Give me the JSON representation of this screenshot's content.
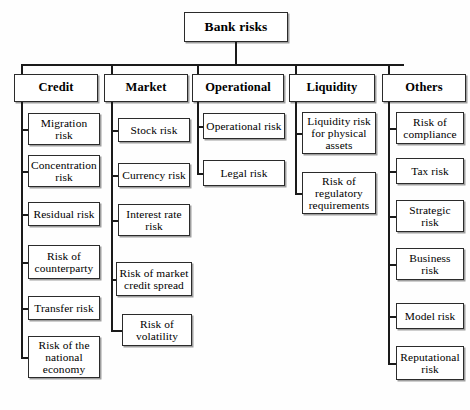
{
  "diagram": {
    "title": "Bank risks",
    "type": "hierarchy-tree",
    "root": {
      "label": "Bank risks",
      "x": 184,
      "y": 12,
      "w": 104,
      "h": 30
    },
    "bus": {
      "y": 64,
      "x1": 22,
      "x2": 404
    },
    "categories": [
      {
        "label": "Credit",
        "box": {
          "x": 14,
          "y": 74,
          "w": 84,
          "h": 28
        },
        "connector_x": 22,
        "children": [
          {
            "label": "Migration\nrisk",
            "x": 28,
            "y": 113,
            "w": 72,
            "h": 32
          },
          {
            "label": "Concentration\nrisk",
            "x": 28,
            "y": 155,
            "w": 72,
            "h": 32
          },
          {
            "label": "Residual risk",
            "x": 28,
            "y": 202,
            "w": 72,
            "h": 24
          },
          {
            "label": "Risk of\ncounterparty",
            "x": 28,
            "y": 245,
            "w": 72,
            "h": 34
          },
          {
            "label": "Transfer risk",
            "x": 28,
            "y": 296,
            "w": 72,
            "h": 24
          },
          {
            "label": "Risk of the\nnational\neconomy",
            "x": 28,
            "y": 336,
            "w": 72,
            "h": 42
          }
        ]
      },
      {
        "label": "Market",
        "box": {
          "x": 104,
          "y": 74,
          "w": 84,
          "h": 28
        },
        "connector_x": 112,
        "children": [
          {
            "label": "Stock risk",
            "x": 118,
            "y": 118,
            "w": 72,
            "h": 24
          },
          {
            "label": "Currency risk",
            "x": 118,
            "y": 163,
            "w": 72,
            "h": 24
          },
          {
            "label": "Interest rate\nrisk",
            "x": 118,
            "y": 204,
            "w": 72,
            "h": 32
          },
          {
            "label": "Risk of market\ncredit spread",
            "x": 116,
            "y": 262,
            "w": 76,
            "h": 34
          },
          {
            "label": "Risk of\nvolatility",
            "x": 122,
            "y": 314,
            "w": 70,
            "h": 32
          }
        ]
      },
      {
        "label": "Operational",
        "box": {
          "x": 192,
          "y": 74,
          "w": 92,
          "h": 28
        },
        "connector_x": 198,
        "children": [
          {
            "label": "Operational risk",
            "x": 203,
            "y": 113,
            "w": 82,
            "h": 26
          },
          {
            "label": "Legal risk",
            "x": 203,
            "y": 160,
            "w": 82,
            "h": 26
          }
        ]
      },
      {
        "label": "Liquidity",
        "box": {
          "x": 289,
          "y": 74,
          "w": 86,
          "h": 28
        },
        "connector_x": 296,
        "children": [
          {
            "label": "Liquidity  risk\nfor physical\nassets",
            "x": 302,
            "y": 112,
            "w": 74,
            "h": 42
          },
          {
            "label": "Risk of\nregulatory\nrequirements",
            "x": 302,
            "y": 172,
            "w": 74,
            "h": 42
          }
        ]
      },
      {
        "label": "Others",
        "box": {
          "x": 382,
          "y": 74,
          "w": 84,
          "h": 28
        },
        "connector_x": 389,
        "children": [
          {
            "label": "Risk of\ncompliance",
            "x": 396,
            "y": 112,
            "w": 68,
            "h": 32
          },
          {
            "label": "Tax risk",
            "x": 396,
            "y": 158,
            "w": 68,
            "h": 26
          },
          {
            "label": "Strategic\nrisk",
            "x": 396,
            "y": 200,
            "w": 68,
            "h": 32
          },
          {
            "label": "Business\nrisk",
            "x": 396,
            "y": 248,
            "w": 68,
            "h": 32
          },
          {
            "label": "Model risk",
            "x": 396,
            "y": 303,
            "w": 68,
            "h": 26
          },
          {
            "label": "Reputational\nrisk",
            "x": 396,
            "y": 346,
            "w": 68,
            "h": 34
          }
        ]
      }
    ]
  }
}
